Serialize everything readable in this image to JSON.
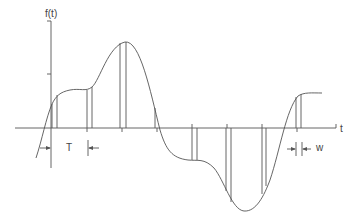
{
  "labels": {
    "y_axis": "f(t)",
    "x_axis": "t",
    "period": "T",
    "width": "w"
  },
  "figure": {
    "stroke_color": "#555555",
    "background": "#ffffff",
    "sample_tick_x": [
      52,
      87,
      122,
      157,
      192,
      227,
      262,
      297
    ],
    "aperture_px": 5
  }
}
